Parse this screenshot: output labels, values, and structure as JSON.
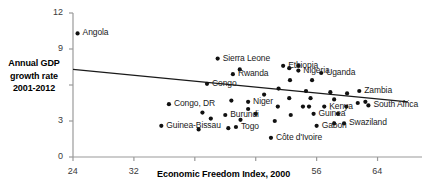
{
  "chart_data": {
    "type": "scatter",
    "title": "",
    "xlabel": "Economic Freedom Index, 2000",
    "ylabel": "Annual GDP growth rate 2001-2012",
    "ylabel_lines": [
      "Annual GDP",
      "growth rate",
      "2001-2012"
    ],
    "xlim": [
      24,
      68
    ],
    "ylim": [
      0,
      12
    ],
    "xticks": [
      24,
      32,
      40,
      48,
      56,
      64
    ],
    "xtick_labels": [
      "24",
      "32",
      "",
      "",
      "56",
      "64"
    ],
    "yticks": [
      0,
      3,
      6,
      9,
      12
    ],
    "ytick_labels": [
      "0",
      "3",
      "",
      "9",
      "12"
    ],
    "grid": false,
    "legend": "none",
    "trendline": {
      "x0": 24,
      "y0": 7.3,
      "x1": 68,
      "y1": 4.6
    },
    "labeled_points": [
      {
        "label": "Angola",
        "x": 24.6,
        "y": 10.3
      },
      {
        "label": "Sierra Leone",
        "x": 43.0,
        "y": 8.2
      },
      {
        "label": "Ethiopia",
        "x": 51.6,
        "y": 7.6
      },
      {
        "label": "Nigeria",
        "x": 53.6,
        "y": 7.2
      },
      {
        "label": "Uganda",
        "x": 56.6,
        "y": 7.0
      },
      {
        "label": "Rwanda",
        "x": 45.0,
        "y": 6.9
      },
      {
        "label": "Zambia",
        "x": 61.6,
        "y": 5.5
      },
      {
        "label": "Congo",
        "x": 41.6,
        "y": 6.1
      },
      {
        "label": "Niger",
        "x": 47.0,
        "y": 4.6
      },
      {
        "label": "Kenya",
        "x": 57.0,
        "y": 4.2
      },
      {
        "label": "South Africa",
        "x": 62.8,
        "y": 4.3
      },
      {
        "label": "Congo, DR",
        "x": 36.6,
        "y": 4.4
      },
      {
        "label": "Burundi",
        "x": 44.0,
        "y": 3.5
      },
      {
        "label": "Guinea",
        "x": 55.6,
        "y": 3.6
      },
      {
        "label": "Swaziland",
        "x": 59.6,
        "y": 2.8
      },
      {
        "label": "Guinea-Bissau",
        "x": 35.6,
        "y": 2.6
      },
      {
        "label": "Togo",
        "x": 45.4,
        "y": 2.5
      },
      {
        "label": "Gabon",
        "x": 56.0,
        "y": 2.6
      },
      {
        "label": "Côte d'Ivoire",
        "x": 50.0,
        "y": 1.6
      }
    ],
    "unlabeled_points": [
      {
        "x": 52.4,
        "y": 7.4
      },
      {
        "x": 53.6,
        "y": 7.6
      },
      {
        "x": 45.9,
        "y": 7.3
      },
      {
        "x": 52.5,
        "y": 6.4
      },
      {
        "x": 55.4,
        "y": 6.4
      },
      {
        "x": 51.0,
        "y": 5.7
      },
      {
        "x": 54.6,
        "y": 5.5
      },
      {
        "x": 57.8,
        "y": 5.4
      },
      {
        "x": 60.0,
        "y": 5.3
      },
      {
        "x": 49.1,
        "y": 5.2
      },
      {
        "x": 52.4,
        "y": 4.9
      },
      {
        "x": 55.2,
        "y": 4.9
      },
      {
        "x": 58.3,
        "y": 4.8
      },
      {
        "x": 44.8,
        "y": 4.7
      },
      {
        "x": 61.4,
        "y": 4.5
      },
      {
        "x": 62.4,
        "y": 4.6
      },
      {
        "x": 47.0,
        "y": 4.0
      },
      {
        "x": 50.9,
        "y": 4.2
      },
      {
        "x": 54.2,
        "y": 4.2
      },
      {
        "x": 55.0,
        "y": 4.2
      },
      {
        "x": 59.9,
        "y": 4.2
      },
      {
        "x": 41.0,
        "y": 3.7
      },
      {
        "x": 48.0,
        "y": 3.6
      },
      {
        "x": 52.6,
        "y": 3.5
      },
      {
        "x": 58.8,
        "y": 3.6
      },
      {
        "x": 42.1,
        "y": 3.2
      },
      {
        "x": 46.0,
        "y": 3.1
      },
      {
        "x": 50.5,
        "y": 3.0
      },
      {
        "x": 58.3,
        "y": 2.8
      },
      {
        "x": 44.4,
        "y": 2.4
      },
      {
        "x": 40.5,
        "y": 2.3
      }
    ]
  }
}
